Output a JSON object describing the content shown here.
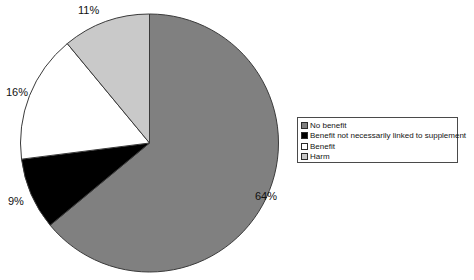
{
  "chart_data": {
    "type": "pie",
    "title": "",
    "categories": [
      "No benefit",
      "Benefit not necessarily linked to supplement",
      "Benefit",
      "Harm"
    ],
    "values": [
      64,
      9,
      16,
      11
    ],
    "value_labels": [
      "64%",
      "9%",
      "16%",
      "11%"
    ],
    "units": "percent",
    "start_angle_deg": 0,
    "direction": "clockwise",
    "legend_position": "right",
    "grid": false,
    "colors": [
      "#808080",
      "#000000",
      "#ffffff",
      "#c9c9c9"
    ],
    "slice_border_color": "#3a3a3a",
    "background": "#ffffff"
  },
  "labels": {
    "no_benefit": "64%",
    "benefit_not_necessarily": "9%",
    "benefit": "16%",
    "harm": "11%"
  },
  "legend": {
    "items": [
      {
        "label": "No benefit",
        "color": "#808080"
      },
      {
        "label": "Benefit not necessarily linked to supplement",
        "color": "#000000"
      },
      {
        "label": "Benefit",
        "color": "#ffffff"
      },
      {
        "label": "Harm",
        "color": "#c9c9c9"
      }
    ]
  }
}
